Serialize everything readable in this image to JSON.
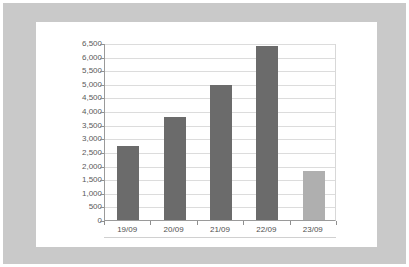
{
  "colors": {
    "frame": "#c9c9c9",
    "panel_background": "#ffffff",
    "bar_primary": "#6b6b6b",
    "bar_highlight": "#afafaf",
    "gridline": "#dcdcdc",
    "axis": "#9a9a9a",
    "tick_text": "#5a5a5a"
  },
  "chart_data": {
    "type": "bar",
    "title": "",
    "subtitle": "",
    "xlabel": "",
    "ylabel": "",
    "categories": [
      "19/09",
      "20/09",
      "21/09",
      "22/09",
      "23/09"
    ],
    "values": [
      2700,
      3800,
      4950,
      6400,
      1800
    ],
    "bar_colors": [
      "#6b6b6b",
      "#6b6b6b",
      "#6b6b6b",
      "#6b6b6b",
      "#afafaf"
    ],
    "ylim": [
      0,
      6500
    ],
    "ytick_step": 500,
    "ytick_labels": [
      "6,500",
      "6,000",
      "5,500",
      "5,000",
      "4,500",
      "4,000",
      "3,500",
      "3,000",
      "2,500",
      "2,000",
      "1,500",
      "1,000",
      "500",
      "0"
    ],
    "ytick_values": [
      6500,
      6000,
      5500,
      5000,
      4500,
      4000,
      3500,
      3000,
      2500,
      2000,
      1500,
      1000,
      500,
      0
    ],
    "grid": true,
    "legend": null,
    "legend_position": "none",
    "annotations": []
  }
}
